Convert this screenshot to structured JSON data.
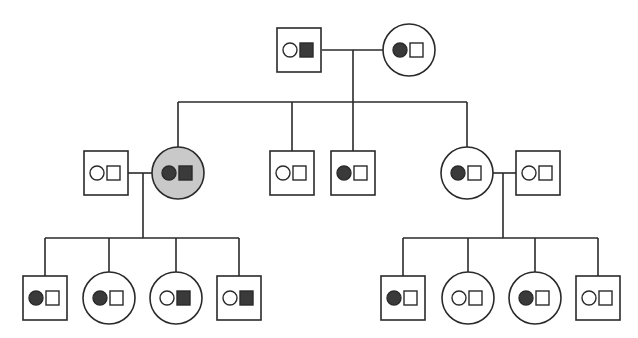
{
  "diagram": {
    "type": "pedigree",
    "colors": {
      "line": "#2a2a2a",
      "filled": "#3a3a3a",
      "empty": "#ffffff",
      "affected_shading": "#c9c9c9"
    },
    "individuals": [
      {
        "id": "gen1-father",
        "sex": "male",
        "x": 299,
        "y": 50,
        "circle_allele": "empty",
        "square_allele": "filled",
        "affected": false
      },
      {
        "id": "gen1-mother",
        "sex": "female",
        "x": 409,
        "y": 50,
        "circle_allele": "filled",
        "square_allele": "empty",
        "affected": false
      },
      {
        "id": "gen2-spouse-left",
        "sex": "male",
        "x": 106,
        "y": 173,
        "circle_allele": "empty",
        "square_allele": "empty",
        "affected": false
      },
      {
        "id": "gen2-daughter-1",
        "sex": "female",
        "x": 178,
        "y": 173,
        "circle_allele": "filled",
        "square_allele": "filled",
        "affected": true
      },
      {
        "id": "gen2-son-1",
        "sex": "male",
        "x": 292,
        "y": 173,
        "circle_allele": "empty",
        "square_allele": "empty",
        "affected": false
      },
      {
        "id": "gen2-son-2",
        "sex": "male",
        "x": 353,
        "y": 173,
        "circle_allele": "filled",
        "square_allele": "empty",
        "affected": false
      },
      {
        "id": "gen2-daughter-2",
        "sex": "female",
        "x": 467,
        "y": 173,
        "circle_allele": "filled",
        "square_allele": "empty",
        "affected": false
      },
      {
        "id": "gen2-spouse-right",
        "sex": "male",
        "x": 538,
        "y": 173,
        "circle_allele": "empty",
        "square_allele": "empty",
        "affected": false
      },
      {
        "id": "gen3-left-1",
        "sex": "male",
        "x": 45,
        "y": 298,
        "circle_allele": "filled",
        "square_allele": "empty",
        "affected": false
      },
      {
        "id": "gen3-left-2",
        "sex": "female",
        "x": 109,
        "y": 298,
        "circle_allele": "filled",
        "square_allele": "empty",
        "affected": false
      },
      {
        "id": "gen3-left-3",
        "sex": "female",
        "x": 176,
        "y": 298,
        "circle_allele": "empty",
        "square_allele": "filled",
        "affected": false
      },
      {
        "id": "gen3-left-4",
        "sex": "male",
        "x": 239,
        "y": 298,
        "circle_allele": "empty",
        "square_allele": "filled",
        "affected": false
      },
      {
        "id": "gen3-right-1",
        "sex": "male",
        "x": 403,
        "y": 298,
        "circle_allele": "filled",
        "square_allele": "empty",
        "affected": false
      },
      {
        "id": "gen3-right-2",
        "sex": "female",
        "x": 468,
        "y": 298,
        "circle_allele": "empty",
        "square_allele": "empty",
        "affected": false
      },
      {
        "id": "gen3-right-3",
        "sex": "female",
        "x": 535,
        "y": 298,
        "circle_allele": "filled",
        "square_allele": "empty",
        "affected": false
      },
      {
        "id": "gen3-right-4",
        "sex": "male",
        "x": 598,
        "y": 298,
        "circle_allele": "empty",
        "square_allele": "empty",
        "affected": false
      }
    ]
  }
}
